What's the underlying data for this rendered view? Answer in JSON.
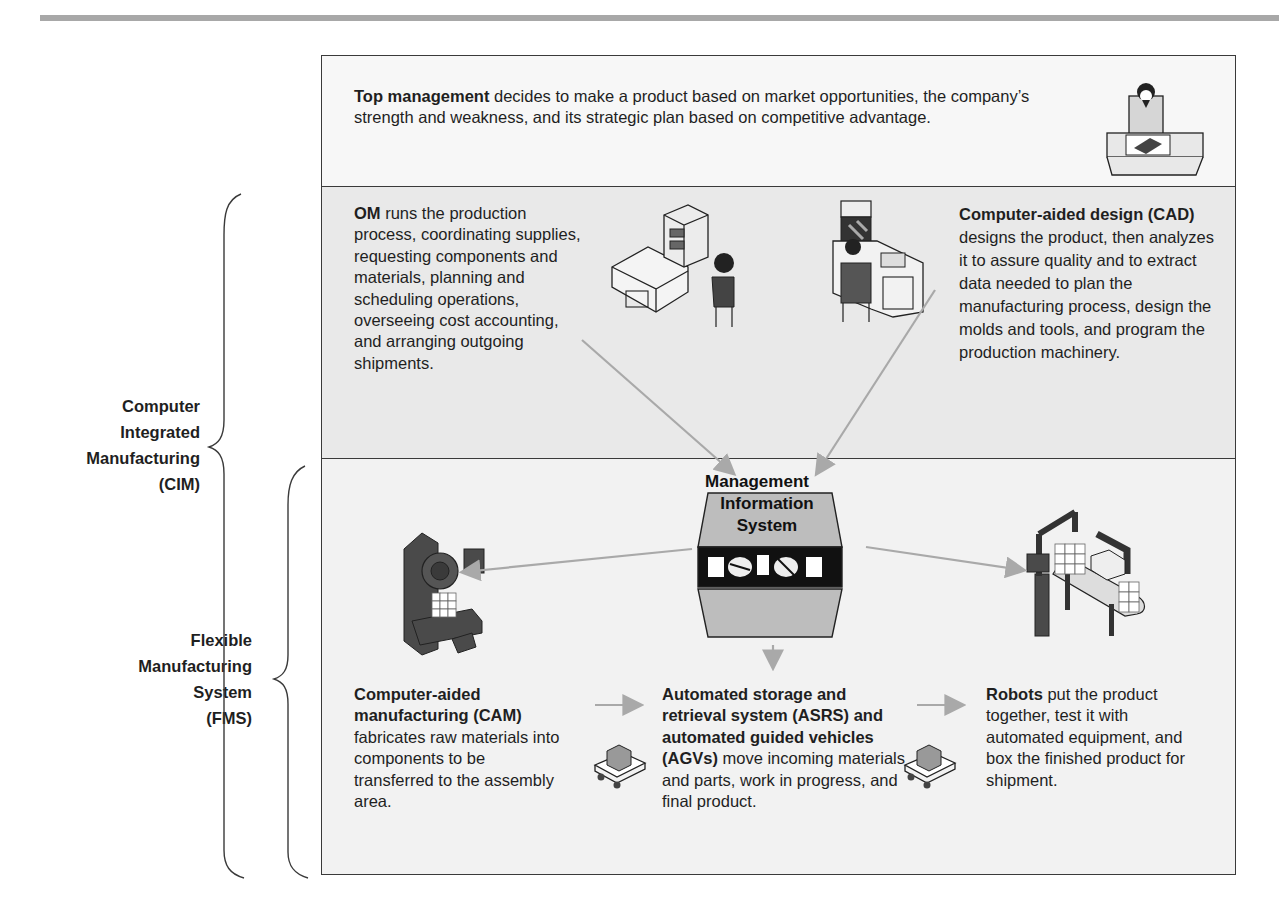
{
  "page": {
    "header_rule_color": "#a8a8a8"
  },
  "top_section": {
    "bold": "Top management",
    "text": " decides to make a product based on market opportunities, the company’s strength and weakness, and its strategic plan based on competitive advantage.",
    "icon": "executive-at-desk-icon"
  },
  "middle_section": {
    "om": {
      "bold": "OM",
      "text": " runs the production process, coordinating supplies, requesting components and materials, planning and scheduling operations, overseeing cost accounting, and arranging outgoing shipments.",
      "icon": "computer-workstation-icon"
    },
    "cad": {
      "bold": "Computer-aided design (CAD)",
      "text": " designs the product, then analyzes it to assure quality and to extract data needed to plan the manufacturing process, design the molds and tools, and program the production machinery.",
      "icon": "cad-workstation-icon"
    }
  },
  "bottom_section": {
    "mis": {
      "line1": "Management",
      "line2": "Information",
      "line3": "System",
      "icon": "mainframe-icon"
    },
    "cam": {
      "bold": "Computer-aided manufacturing (CAM)",
      "text": " fabricates raw materials into components to be transferred to the assembly area.",
      "icon": "cnc-machine-icon"
    },
    "asrs": {
      "bold": "Automated storage and retrieval system (ASRS) and automated guided vehicles (AGVs)",
      "text": " move incoming materials and parts, work in progress, and final product.",
      "icon": "agv-cart-icon"
    },
    "robots": {
      "bold": "Robots",
      "text": " put the product together, test it with automated equipment, and box the finished product for shipment.",
      "icon": "robot-assembly-line-icon"
    }
  },
  "braces": {
    "cim": {
      "line1": "Computer",
      "line2": "Integrated",
      "line3": "Manufacturing",
      "line4": "(CIM)"
    },
    "fms": {
      "line1": "Flexible",
      "line2": "Manufacturing",
      "line3": "System",
      "line4": "(FMS)"
    }
  },
  "colors": {
    "top_bg": "#f7f7f7",
    "middle_bg": "#e9e9e9",
    "bottom_bg": "#f2f2f2",
    "arrow": "#a9a9a9",
    "machine_dark": "#4a4a4a"
  }
}
